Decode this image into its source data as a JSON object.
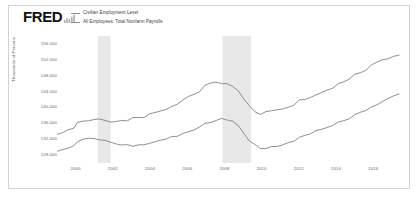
{
  "brand": {
    "wordmark": "FRED",
    "glyph_icon": "bar-chart-icon"
  },
  "legend": {
    "position": "top-left",
    "items": [
      {
        "label": "Civilian Employment Level",
        "color": "#8d8d8d",
        "marker": "line-dash"
      },
      {
        "label": "All Employees: Total Nonfarm Payrolls",
        "color": "#8d8d8d",
        "marker": "line-dash"
      }
    ]
  },
  "axes": {
    "ylabel": "Thousands of Persons",
    "yticks": [
      "156,000",
      "152,000",
      "148,000",
      "144,000",
      "140,000",
      "136,000",
      "132,000",
      "128,000"
    ],
    "xticks": [
      "2000",
      "2002",
      "2004",
      "2006",
      "2008",
      "2010",
      "2012",
      "2014",
      "2016"
    ]
  },
  "colors": {
    "line": "#7b7b7b",
    "recession_band": "#e8e8e8",
    "border": "#d2d2d2",
    "tick_text": "#6a6a6a",
    "background": "#ffffff"
  },
  "chart_data": {
    "type": "line",
    "title": "",
    "xlabel": "",
    "ylabel": "Thousands of Persons",
    "xlim": [
      1999.0,
      2017.6
    ],
    "ylim": [
      126000,
      158000
    ],
    "grid": false,
    "legend_position": "top-left",
    "recessions": [
      {
        "start": 2001.2,
        "end": 2001.9
      },
      {
        "start": 2007.95,
        "end": 2009.5
      }
    ],
    "series": [
      {
        "name": "Civilian Employment Level",
        "color": "#7b7b7b",
        "x": [
          1999.0,
          1999.3,
          1999.6,
          1999.9,
          2000.1,
          2000.4,
          2000.7,
          2001.0,
          2001.3,
          2001.6,
          2001.9,
          2002.2,
          2002.5,
          2002.8,
          2003.1,
          2003.4,
          2003.7,
          2004.0,
          2004.3,
          2004.6,
          2004.9,
          2005.2,
          2005.5,
          2005.8,
          2006.1,
          2006.4,
          2006.7,
          2007.0,
          2007.3,
          2007.6,
          2007.9,
          2008.2,
          2008.5,
          2008.8,
          2009.1,
          2009.4,
          2009.7,
          2010.0,
          2010.3,
          2010.6,
          2010.9,
          2011.2,
          2011.5,
          2011.8,
          2012.1,
          2012.4,
          2012.7,
          2013.0,
          2013.3,
          2013.6,
          2013.9,
          2014.2,
          2014.5,
          2014.8,
          2015.1,
          2015.4,
          2015.7,
          2016.0,
          2016.3,
          2016.6,
          2016.9,
          2017.2,
          2017.5
        ],
        "y": [
          133200,
          133900,
          134400,
          134900,
          136300,
          136700,
          136800,
          137000,
          136900,
          136600,
          136300,
          136400,
          136500,
          136600,
          137400,
          137600,
          137700,
          138500,
          138900,
          139200,
          139700,
          140400,
          141000,
          141700,
          142500,
          143100,
          143800,
          145300,
          145900,
          146200,
          146300,
          146200,
          145400,
          144300,
          142200,
          140600,
          139200,
          138500,
          138800,
          139100,
          139300,
          139600,
          139900,
          140300,
          141800,
          142200,
          142600,
          143300,
          143800,
          144400,
          144900,
          146000,
          146400,
          147000,
          148200,
          148700,
          149200,
          150500,
          151200,
          151800,
          152300,
          152900,
          153400
        ]
      },
      {
        "name": "All Employees: Total Nonfarm Payrolls",
        "color": "#7b7b7b",
        "x": [
          1999.0,
          1999.3,
          1999.6,
          1999.9,
          2000.1,
          2000.4,
          2000.7,
          2001.0,
          2001.3,
          2001.6,
          2001.9,
          2002.2,
          2002.5,
          2002.8,
          2003.1,
          2003.4,
          2003.7,
          2004.0,
          2004.3,
          2004.6,
          2004.9,
          2005.2,
          2005.5,
          2005.8,
          2006.1,
          2006.4,
          2006.7,
          2007.0,
          2007.3,
          2007.6,
          2007.9,
          2008.2,
          2008.5,
          2008.8,
          2009.1,
          2009.4,
          2009.7,
          2010.0,
          2010.3,
          2010.6,
          2010.9,
          2011.2,
          2011.5,
          2011.8,
          2012.1,
          2012.4,
          2012.7,
          2013.0,
          2013.3,
          2013.6,
          2013.9,
          2014.2,
          2014.5,
          2014.8,
          2015.1,
          2015.4,
          2015.7,
          2016.0,
          2016.3,
          2016.6,
          2016.9,
          2017.2,
          2017.5
        ],
        "y": [
          128700,
          129100,
          129600,
          130100,
          131300,
          131700,
          132000,
          132300,
          132100,
          131800,
          131400,
          131000,
          130800,
          130700,
          130400,
          130300,
          130300,
          130800,
          131200,
          131600,
          132000,
          132500,
          133000,
          133500,
          134100,
          134600,
          135100,
          136000,
          136400,
          136800,
          137000,
          136800,
          136300,
          135300,
          133400,
          131500,
          130400,
          129800,
          129900,
          130200,
          130400,
          130800,
          131200,
          131600,
          132400,
          132900,
          133300,
          133900,
          134400,
          134900,
          135400,
          136200,
          136800,
          137400,
          138200,
          138800,
          139400,
          140300,
          140900,
          141500,
          142100,
          142700,
          143200
        ]
      }
    ]
  }
}
